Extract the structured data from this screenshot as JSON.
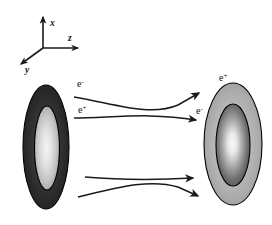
{
  "figure": {
    "background_color": "#ffffff"
  },
  "axes": {
    "name": "coordinate-system",
    "origin": {
      "x": 43,
      "y": 48
    },
    "labels": {
      "x": "x",
      "y": "y",
      "z": "z"
    },
    "directions": {
      "x": "up",
      "y": "down-left",
      "z": "right"
    },
    "color": "#1a1a1a"
  },
  "bunches": [
    {
      "id": "left-bunch",
      "label": "e",
      "charge_sign": "-",
      "label_full": "e-",
      "center": {
        "x": 46,
        "y": 147
      },
      "rx": 23,
      "ry": 62,
      "outer_color": "#2f2f2f",
      "inner_color": "#e8e8e8",
      "outline_color": "#000000",
      "description": "dark outer halo with bright vertical core"
    },
    {
      "id": "right-bunch",
      "label": "e",
      "charge_sign": "+",
      "label_full": "e+",
      "center": {
        "x": 233,
        "y": 144
      },
      "rx": 29,
      "ry": 61,
      "outer_color": "#b5b5b5",
      "inner_color": "#f2f2f2",
      "outline_color": "#000000",
      "description": "light gray outer halo with darker ring and bright core"
    }
  ],
  "particle_labels": [
    {
      "id": "label-left-electron",
      "base": "e",
      "sup": "-",
      "x": 77,
      "y": 87
    },
    {
      "id": "label-left-positron",
      "base": "e",
      "sup": "+",
      "x": 78,
      "y": 113
    },
    {
      "id": "label-right-positron",
      "base": "e",
      "sup": "+",
      "x": 219,
      "y": 81
    },
    {
      "id": "label-right-electron",
      "base": "e",
      "sup": "-",
      "x": 196,
      "y": 114
    }
  ],
  "trajectories": [
    {
      "id": "upper-trajectory-1",
      "from": {
        "x": 74,
        "y": 97
      },
      "to": {
        "x": 201,
        "y": 92
      },
      "style": "curved",
      "arrowhead": true,
      "note": "starts upper-left of left bunch, bends upward to right bunch"
    },
    {
      "id": "upper-trajectory-2",
      "from": {
        "x": 74,
        "y": 118
      },
      "to": {
        "x": 197,
        "y": 120
      },
      "style": "straight",
      "arrowhead": true,
      "note": "crosses the first upper trajectory near center"
    },
    {
      "id": "lower-trajectory-1",
      "from": {
        "x": 85,
        "y": 177
      },
      "to": {
        "x": 195,
        "y": 178
      },
      "style": "straight",
      "arrowhead": true,
      "note": "upper of the lower pair"
    },
    {
      "id": "lower-trajectory-2",
      "from": {
        "x": 78,
        "y": 197
      },
      "to": {
        "x": 200,
        "y": 197
      },
      "style": "curved",
      "arrowhead": true,
      "note": "crosses the other lower trajectory near center"
    }
  ],
  "colors": {
    "ink": "#1a1a1a",
    "background": "#ffffff"
  }
}
